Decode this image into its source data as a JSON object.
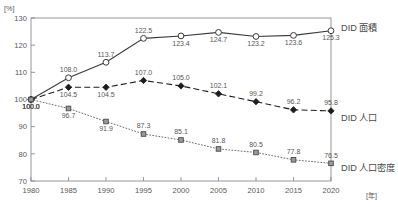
{
  "chart_data": {
    "type": "line",
    "title": "",
    "subtitle": "",
    "xlabel": "[年]",
    "ylabel": "[%]",
    "x": [
      1980,
      1985,
      1990,
      1995,
      2000,
      2005,
      2010,
      2015,
      2020
    ],
    "categories": [
      "1980",
      "1985",
      "1990",
      "1995",
      "2000",
      "2005",
      "2010",
      "2015",
      "2020"
    ],
    "xlim": [
      1980,
      2020
    ],
    "ylim": [
      70,
      130
    ],
    "yticks": [
      70,
      80,
      90,
      100,
      110,
      120,
      130
    ],
    "ytick_labels": [
      "70",
      "80",
      "90",
      "100",
      "110",
      "120",
      "130"
    ],
    "xticks": [
      1980,
      1985,
      1990,
      1995,
      2000,
      2005,
      2010,
      2015,
      2020
    ],
    "grid": false,
    "legend_position": "right",
    "series": [
      {
        "name": "DID 面積",
        "marker": "open-circle",
        "line_style": "solid",
        "color": "#3a3a3a",
        "values": [
          100.0,
          108.0,
          113.7,
          122.5,
          123.4,
          124.7,
          123.2,
          123.6,
          125.3
        ],
        "data_labels": [
          "100.0",
          "108.0",
          "113.7",
          "122.5",
          "123.4",
          "124.7",
          "123.2",
          "123.6",
          "125.3"
        ],
        "label_positions": [
          "below",
          "above",
          "above",
          "above",
          "below",
          "below",
          "below",
          "below",
          "below"
        ]
      },
      {
        "name": "DID 人口",
        "marker": "filled-diamond",
        "line_style": "dashed",
        "color": "#1d1d1d",
        "values": [
          100.0,
          104.5,
          104.5,
          107.0,
          105.0,
          102.1,
          99.2,
          96.2,
          95.8
        ],
        "data_labels": [
          "100.0",
          "104.5",
          "104.5",
          "107.0",
          "105.0",
          "102.1",
          "99.2",
          "96.2",
          "95.8"
        ],
        "label_positions": [
          "below",
          "below",
          "below",
          "above",
          "above",
          "above",
          "above",
          "above",
          "above"
        ]
      },
      {
        "name": "DID 人口密度",
        "marker": "small-square",
        "line_style": "dotted",
        "color": "#707070",
        "values": [
          100.0,
          96.7,
          91.9,
          87.3,
          85.1,
          81.8,
          80.5,
          77.8,
          76.5
        ],
        "data_labels": [
          "100.0",
          "96.7",
          "91.9",
          "87.3",
          "85.1",
          "81.8",
          "80.5",
          "77.8",
          "76.5"
        ],
        "label_positions": [
          "below",
          "below",
          "below",
          "above",
          "above",
          "above",
          "above",
          "above",
          "above"
        ]
      }
    ]
  },
  "axes": {
    "y_unit": "[%]",
    "x_unit": "[年]"
  },
  "legend": {
    "items": [
      {
        "label": "DID 面積"
      },
      {
        "label": "DID 人口"
      },
      {
        "label": "DID 人口密度"
      }
    ]
  }
}
